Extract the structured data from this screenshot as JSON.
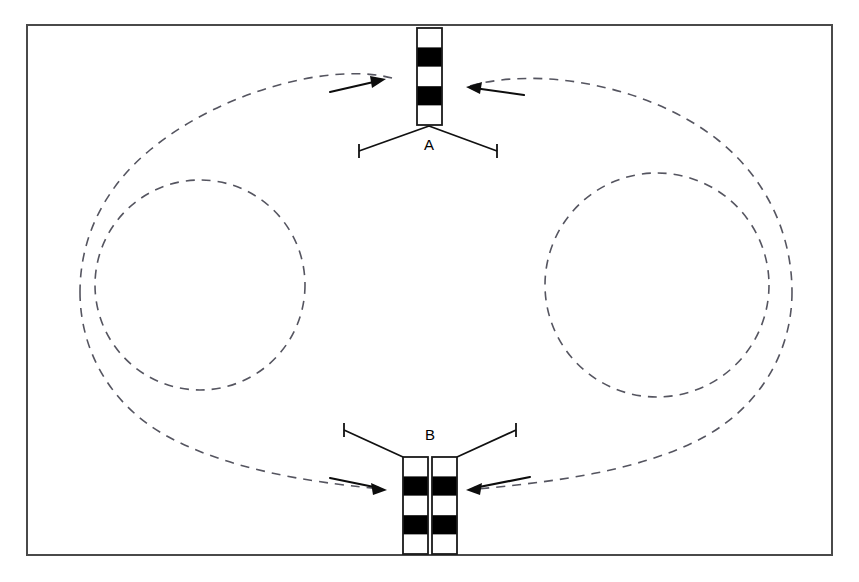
{
  "figure": {
    "background_color": "#ffffff",
    "width": 859,
    "height": 582
  },
  "frame": {
    "name": "outer-border",
    "x": 27,
    "y": 25,
    "width": 805,
    "height": 530,
    "stroke_color": "#4a4a4a",
    "stroke_width": 2
  },
  "labels": {
    "upper": "A",
    "lower": "B"
  },
  "structures": [
    {
      "id": "A",
      "label": "A",
      "position": "top-center",
      "bar_count": 1,
      "bars": [
        {
          "x": 417,
          "y": 28,
          "width": 25,
          "height": 97,
          "segments": [
            "white",
            "black",
            "white",
            "black",
            "white"
          ]
        }
      ],
      "label_x": 429,
      "label_y": 146,
      "marker": {
        "type": "vee-down",
        "apex_x": 429,
        "apex_y": 126,
        "left_end_x": 359,
        "left_end_y": 151,
        "right_end_x": 497,
        "right_end_y": 151,
        "tick_half_length": 7
      }
    },
    {
      "id": "B",
      "label": "B",
      "position": "bottom-center",
      "bar_count": 2,
      "bars": [
        {
          "x": 403,
          "y": 457,
          "width": 25,
          "height": 97,
          "segments": [
            "white",
            "black",
            "white",
            "black",
            "white"
          ]
        },
        {
          "x": 432,
          "y": 457,
          "width": 25,
          "height": 97,
          "segments": [
            "white",
            "black",
            "white",
            "black",
            "white"
          ]
        }
      ],
      "label_x": 430,
      "label_y": 436,
      "marker": {
        "type": "vee-up",
        "apex_left_x": 403,
        "apex_right_x": 457,
        "apex_y": 457,
        "left_end_x": 344,
        "left_end_y": 430,
        "right_end_x": 516,
        "right_end_y": 430,
        "tick_half_length": 7
      }
    }
  ],
  "dashed_curves": [
    {
      "name": "left-circulation-circle",
      "shape": "circle",
      "cx": 200,
      "cy": 285,
      "r": 105,
      "stroke_color": "#555560",
      "dash": "9 7"
    },
    {
      "name": "right-circulation-circle",
      "shape": "circle",
      "cx": 657,
      "cy": 285,
      "r": 112,
      "stroke_color": "#555560",
      "dash": "9 7"
    },
    {
      "name": "outer-circulation-loop",
      "shape": "closed-loop",
      "stroke_color": "#555560",
      "dash": "9 7",
      "description": "large oval loop passing from structure A around both sides down to structure B"
    }
  ],
  "arrows": [
    {
      "name": "arrow-upper-left",
      "direction": "right",
      "tip_x": 386,
      "tip_y": 79,
      "tail_x": 330,
      "tail_y": 92,
      "points_toward": "A"
    },
    {
      "name": "arrow-upper-right",
      "direction": "left",
      "tip_x": 466,
      "tip_y": 89,
      "tail_x": 524,
      "tail_y": 95,
      "points_toward": "A"
    },
    {
      "name": "arrow-lower-left",
      "direction": "right",
      "tip_x": 387,
      "tip_y": 490,
      "tail_x": 330,
      "tail_y": 478,
      "points_toward": "B"
    },
    {
      "name": "arrow-lower-right",
      "direction": "left",
      "tip_x": 466,
      "tip_y": 490,
      "tail_x": 530,
      "tail_y": 477,
      "points_toward": "B"
    }
  ],
  "colors": {
    "ink": "#000000",
    "frame": "#4a4a4a",
    "dashed": "#555560",
    "fill_white": "#ffffff"
  }
}
